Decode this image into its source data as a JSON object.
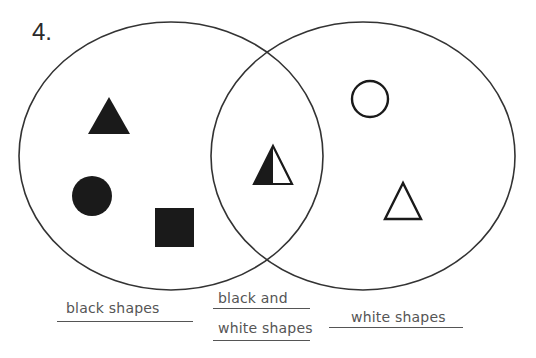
{
  "problem_number": "4.",
  "diagram": {
    "type": "venn",
    "sets": [
      {
        "name": "left",
        "label": "black shapes",
        "shapes": [
          {
            "kind": "triangle",
            "fill": "black"
          },
          {
            "kind": "circle",
            "fill": "black"
          },
          {
            "kind": "square",
            "fill": "black"
          }
        ]
      },
      {
        "name": "intersection",
        "label_line1": "black and",
        "label_line2": "white shapes",
        "shapes": [
          {
            "kind": "triangle",
            "fill": "half black / half white"
          }
        ]
      },
      {
        "name": "right",
        "label": "white shapes",
        "shapes": [
          {
            "kind": "circle",
            "fill": "white"
          },
          {
            "kind": "triangle",
            "fill": "white"
          }
        ]
      }
    ]
  },
  "labels": {
    "left": "black shapes",
    "middle_line1": "black and",
    "middle_line2": "white shapes",
    "right": "white shapes"
  },
  "colors": {
    "stroke": "#333333",
    "fill_black": "#1a1a1a",
    "label_text": "#555555"
  }
}
